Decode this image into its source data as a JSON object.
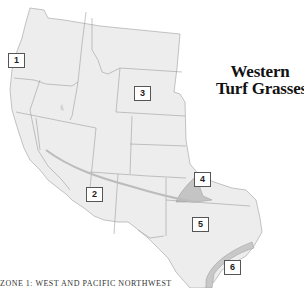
{
  "title": {
    "line1": "Western",
    "line2": "Turf Grasses"
  },
  "zones": [
    {
      "id": "1",
      "label": "1"
    },
    {
      "id": "2",
      "label": "2"
    },
    {
      "id": "3",
      "label": "3"
    },
    {
      "id": "4",
      "label": "4"
    },
    {
      "id": "5",
      "label": "5"
    },
    {
      "id": "6",
      "label": "6"
    }
  ],
  "caption": "ZONE 1: WEST AND PACIFIC NORTHWEST",
  "colors": {
    "land": "#eeeeee",
    "state_border": "#9a9a9a",
    "zone_line": "#b5b5b5",
    "zone4_fill": "#c8c8c8",
    "zone6_fill": "#cdcdcd",
    "title": "#111111"
  }
}
